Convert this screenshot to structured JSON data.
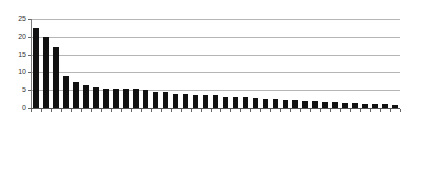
{
  "chart_data": {
    "type": "bar",
    "title": "",
    "subtitle": "",
    "xlabel": "",
    "ylabel": "",
    "ylim": [
      0,
      25
    ],
    "yticks": [
      0,
      5,
      10,
      15,
      20,
      25
    ],
    "grid": true,
    "legend": false,
    "bar_color": "#111111",
    "gridline_color": "#b5b5b5",
    "axis_color": "#666666",
    "categories": [
      "Hong Kong",
      "United States",
      "Israel",
      "Singapore",
      "Canada",
      "Sweden",
      "Denmark",
      "Finland",
      "Norway",
      "Switzerland",
      "China",
      "United Kingdom",
      "France",
      "South Korea",
      "Portugal",
      "India",
      "Ukraine",
      "Germany",
      "Belgium",
      "Netherlands",
      "Brazil",
      "Malaysia",
      "Hungary",
      "Ireland",
      "Vietnam",
      "South Africa",
      "Australia",
      "Austria",
      "Spain",
      "Bulgaria",
      "Russian Federation",
      "Czech Republic",
      "Poland",
      "Italy",
      "Japan",
      "Turkey",
      "Mexico"
    ],
    "values": [
      22.5,
      19.9,
      17.1,
      8.9,
      7.3,
      6.6,
      6.0,
      5.3,
      5.3,
      5.3,
      5.3,
      5.2,
      4.6,
      4.4,
      3.9,
      3.8,
      3.7,
      3.7,
      3.6,
      3.0,
      3.0,
      3.0,
      2.9,
      2.6,
      2.4,
      2.3,
      2.2,
      2.1,
      2.0,
      1.8,
      1.6,
      1.5,
      1.4,
      1.2,
      1.1,
      1.0,
      0.9
    ]
  }
}
